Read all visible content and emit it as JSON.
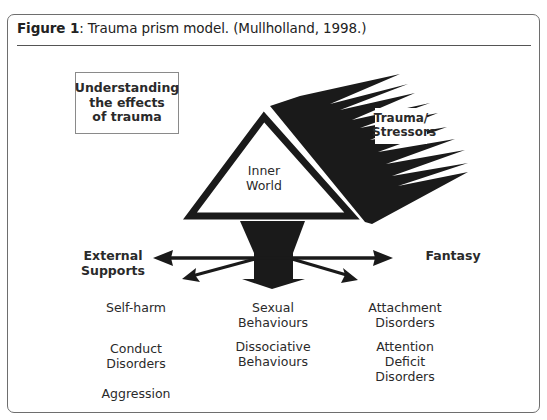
{
  "figure": {
    "label": "Figure 1",
    "title_rest": ": Trauma prism model. (Mullholland, 1998.)"
  },
  "diagram": {
    "header_box": "Understanding\nthe effects\nof trauma",
    "prism_label": "Inner\nWorld",
    "stressor_label": "Trauma/\nStressors",
    "left_label": "External\nSupports",
    "right_label": "Fantasy",
    "outcomes": {
      "left": [
        "Self-harm",
        "Conduct\nDisorders",
        "Aggression"
      ],
      "center": [
        "Sexual\nBehaviours",
        "Dissociative\nBehaviours"
      ],
      "right": [
        "Attachment\nDisorders",
        "Attention\nDeficit\nDisorders"
      ]
    }
  },
  "colors": {
    "ink": "#1a1a1a",
    "frame": "#6e6e6e",
    "text": "#2a2a2a"
  }
}
